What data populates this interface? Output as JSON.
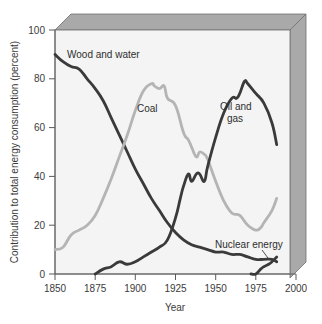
{
  "chart_data": {
    "type": "line",
    "title": "",
    "subtitle": "",
    "xlabel": "Year",
    "ylabel": "Contribution to total energy consumption (percent)",
    "xlim": [
      1850,
      2000
    ],
    "ylim": [
      0,
      100
    ],
    "xticks": [
      1850,
      1875,
      1900,
      1925,
      1950,
      1975,
      2000
    ],
    "yticks": [
      0,
      20,
      40,
      60,
      80,
      100
    ],
    "grid": false,
    "legend": "inline-annotations",
    "colors": {
      "dark_series": "#3a3a3a",
      "light_series": "#b4b4b4",
      "plot_background": "#f4f4f4",
      "bevel_gray": "#a9a9a9",
      "axis": "#6b6b6b"
    },
    "annotations": [
      {
        "text": "Wood and water",
        "x": 1857,
        "y": 88
      },
      {
        "text": "Coal",
        "x": 1902,
        "y": 69
      },
      {
        "text": "Oil and",
        "x": 1953,
        "y": 69
      },
      {
        "text": "gas",
        "x": 1957,
        "y": 63
      },
      {
        "text": "Nuclear energy",
        "x": 1957,
        "y": 14
      }
    ],
    "series": [
      {
        "name": "Wood and water",
        "color": "#3a3a3a",
        "x": [
          1850,
          1855,
          1860,
          1865,
          1870,
          1875,
          1880,
          1885,
          1890,
          1895,
          1900,
          1905,
          1910,
          1915,
          1920,
          1925,
          1930,
          1935,
          1940,
          1945,
          1950,
          1955,
          1960,
          1965,
          1970,
          1975,
          1980,
          1985,
          1988
        ],
        "values": [
          90,
          87,
          85,
          84,
          80,
          76,
          71,
          64,
          57,
          50,
          43,
          37,
          31,
          26,
          21,
          17,
          14,
          12,
          11,
          10,
          9,
          9,
          8,
          8,
          7,
          6,
          6,
          6,
          5
        ]
      },
      {
        "name": "Coal",
        "color": "#b4b4b4",
        "x": [
          1850,
          1855,
          1860,
          1865,
          1870,
          1875,
          1880,
          1885,
          1890,
          1895,
          1900,
          1905,
          1910,
          1912,
          1915,
          1918,
          1920,
          1925,
          1930,
          1933,
          1935,
          1938,
          1940,
          1943,
          1945,
          1950,
          1955,
          1960,
          1965,
          1970,
          1975,
          1978,
          1980,
          1985,
          1988
        ],
        "values": [
          10,
          11,
          16,
          18,
          20,
          24,
          31,
          39,
          48,
          57,
          67,
          75,
          78,
          77,
          76,
          77,
          72,
          69,
          58,
          55,
          52,
          48,
          50,
          49,
          47,
          38,
          30,
          25,
          24,
          20,
          18,
          19,
          21,
          26,
          31
        ]
      },
      {
        "name": "Oil and gas",
        "color": "#3a3a3a",
        "x": [
          1875,
          1880,
          1885,
          1890,
          1895,
          1900,
          1905,
          1910,
          1915,
          1920,
          1925,
          1928,
          1930,
          1933,
          1935,
          1938,
          1940,
          1943,
          1945,
          1950,
          1955,
          1960,
          1963,
          1965,
          1968,
          1970,
          1975,
          1980,
          1985,
          1988
        ],
        "values": [
          0,
          2,
          3,
          5,
          4,
          5,
          7,
          9,
          11,
          14,
          23,
          31,
          36,
          41,
          38,
          41,
          41,
          38,
          44,
          56,
          66,
          72,
          72,
          74,
          79,
          78,
          74,
          70,
          62,
          53
        ]
      },
      {
        "name": "Nuclear energy",
        "color": "#3a3a3a",
        "x": [
          1972,
          1975,
          1978,
          1980,
          1983,
          1985,
          1988
        ],
        "values": [
          0,
          0,
          2,
          3,
          4,
          5,
          7
        ]
      }
    ]
  },
  "axis": {
    "y_title": "Contribution to total energy consumption (percent)",
    "x_title": "Year",
    "y_tick_labels": [
      "100",
      "80",
      "60",
      "40",
      "20",
      "0"
    ],
    "x_tick_labels": [
      "1850",
      "1875",
      "1900",
      "1925",
      "1950",
      "1975",
      "2000"
    ]
  },
  "labels": {
    "wood_and_water": "Wood and water",
    "coal": "Coal",
    "oil_and_gas_line1": "Oil and",
    "oil_and_gas_line2": "gas",
    "nuclear_energy": "Nuclear energy"
  }
}
